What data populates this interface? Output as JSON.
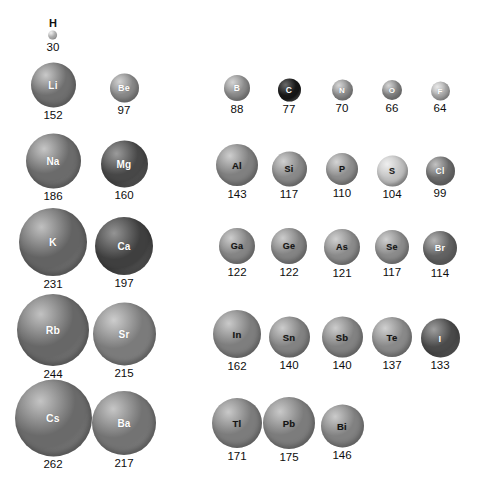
{
  "figure": {
    "units": "pm",
    "background_color": "#ffffff",
    "label_color": "#0d0d0d"
  },
  "chart_data": {
    "type": "scatter",
    "xlabel": "",
    "ylabel": "",
    "grid": false,
    "legend": "none",
    "value_units": "pm",
    "encoding": "sphere diameter proportional to atomic radius",
    "categories": [
      "H",
      "Li",
      "Be",
      "B",
      "C",
      "N",
      "O",
      "F",
      "Na",
      "Mg",
      "Al",
      "Si",
      "P",
      "S",
      "Cl",
      "K",
      "Ca",
      "Ga",
      "Ge",
      "As",
      "Se",
      "Br",
      "Rb",
      "Sr",
      "In",
      "Sn",
      "Sb",
      "Te",
      "I",
      "Cs",
      "Ba",
      "Tl",
      "Pb",
      "Bi"
    ],
    "values": [
      30,
      152,
      97,
      88,
      77,
      70,
      66,
      64,
      186,
      160,
      143,
      117,
      110,
      104,
      99,
      231,
      197,
      122,
      122,
      121,
      117,
      114,
      244,
      215,
      162,
      140,
      140,
      137,
      133,
      262,
      217,
      171,
      175,
      146
    ]
  },
  "elements": [
    {
      "symbol": "H",
      "radius": "30",
      "cx": 53,
      "top": 17,
      "d": 9,
      "base": "#d8d8d8",
      "hi": "#ffffff",
      "text": "#2a2a2a",
      "fs": 6,
      "label_above": true
    },
    {
      "symbol": "Li",
      "radius": "152",
      "cx": 53,
      "top": 62,
      "d": 45,
      "base": "#6f6f6f",
      "hi": "#c9c9c9",
      "text": "#ffffff",
      "fs": 10
    },
    {
      "symbol": "Be",
      "radius": "97",
      "cx": 124,
      "top": 73,
      "d": 29,
      "base": "#8a8a8a",
      "hi": "#d2d2d2",
      "text": "#ffffff",
      "fs": 9
    },
    {
      "symbol": "B",
      "radius": "88",
      "cx": 237,
      "top": 75,
      "d": 26,
      "base": "#8f8f8f",
      "hi": "#d4d4d4",
      "text": "#ffffff",
      "fs": 8.5
    },
    {
      "symbol": "C",
      "radius": "77",
      "cx": 289,
      "top": 78,
      "d": 23,
      "base": "#171717",
      "hi": "#6a6a6a",
      "text": "#ffffff",
      "fs": 8.5
    },
    {
      "symbol": "N",
      "radius": "70",
      "cx": 342,
      "top": 79,
      "d": 21,
      "base": "#939393",
      "hi": "#d6d6d6",
      "text": "#ffffff",
      "fs": 8
    },
    {
      "symbol": "O",
      "radius": "66",
      "cx": 392,
      "top": 80,
      "d": 20,
      "base": "#8c8c8c",
      "hi": "#d5d5d5",
      "text": "#ffffff",
      "fs": 8
    },
    {
      "symbol": "F",
      "radius": "64",
      "cx": 440,
      "top": 81,
      "d": 19,
      "base": "#b4b4b4",
      "hi": "#e8e8e8",
      "text": "#ffffff",
      "fs": 8
    },
    {
      "symbol": "Na",
      "radius": "186",
      "cx": 53,
      "top": 133,
      "d": 55,
      "base": "#6b6b6b",
      "hi": "#c6c6c6",
      "text": "#ffffff",
      "fs": 10
    },
    {
      "symbol": "Mg",
      "radius": "160",
      "cx": 124,
      "top": 140,
      "d": 47,
      "base": "#474747",
      "hi": "#9b9b9b",
      "text": "#ffffff",
      "fs": 10
    },
    {
      "symbol": "Al",
      "radius": "143",
      "cx": 237,
      "top": 144,
      "d": 42,
      "base": "#808080",
      "hi": "#cecece",
      "text": "#141414",
      "fs": 9.5
    },
    {
      "symbol": "Si",
      "radius": "117",
      "cx": 289,
      "top": 151,
      "d": 35,
      "base": "#898989",
      "hi": "#d0d0d0",
      "text": "#141414",
      "fs": 9
    },
    {
      "symbol": "P",
      "radius": "110",
      "cx": 342,
      "top": 153,
      "d": 32,
      "base": "#8e8e8e",
      "hi": "#d4d4d4",
      "text": "#141414",
      "fs": 9
    },
    {
      "symbol": "S",
      "radius": "104",
      "cx": 392,
      "top": 155,
      "d": 31,
      "base": "#c2c2c2",
      "hi": "#efefef",
      "text": "#1a1a1a",
      "fs": 9
    },
    {
      "symbol": "Cl",
      "radius": "99",
      "cx": 440,
      "top": 156,
      "d": 29,
      "base": "#6e6e6e",
      "hi": "#c2c2c2",
      "text": "#ffffff",
      "fs": 8.5
    },
    {
      "symbol": "K",
      "radius": "231",
      "cx": 53,
      "top": 208,
      "d": 68,
      "base": "#636363",
      "hi": "#c0c0c0",
      "text": "#ffffff",
      "fs": 10.5
    },
    {
      "symbol": "Ca",
      "radius": "197",
      "cx": 124,
      "top": 217,
      "d": 58,
      "base": "#3f3f3f",
      "hi": "#949494",
      "text": "#ffffff",
      "fs": 10
    },
    {
      "symbol": "Ga",
      "radius": "122",
      "cx": 237,
      "top": 228,
      "d": 36,
      "base": "#858585",
      "hi": "#cdcdcd",
      "text": "#141414",
      "fs": 9
    },
    {
      "symbol": "Ge",
      "radius": "122",
      "cx": 289,
      "top": 228,
      "d": 36,
      "base": "#848484",
      "hi": "#cccccc",
      "text": "#141414",
      "fs": 9
    },
    {
      "symbol": "As",
      "radius": "121",
      "cx": 342,
      "top": 229,
      "d": 36,
      "base": "#8b8b8b",
      "hi": "#d0d0d0",
      "text": "#141414",
      "fs": 9
    },
    {
      "symbol": "Se",
      "radius": "117",
      "cx": 392,
      "top": 230,
      "d": 34,
      "base": "#8b8b8b",
      "hi": "#d0d0d0",
      "text": "#141414",
      "fs": 9
    },
    {
      "symbol": "Br",
      "radius": "114",
      "cx": 440,
      "top": 231,
      "d": 34,
      "base": "#626262",
      "hi": "#b4b4b4",
      "text": "#ffffff",
      "fs": 9
    },
    {
      "symbol": "Rb",
      "radius": "244",
      "cx": 53,
      "top": 294,
      "d": 72,
      "base": "#676767",
      "hi": "#c2c2c2",
      "text": "#ffffff",
      "fs": 10.5
    },
    {
      "symbol": "Sr",
      "radius": "215",
      "cx": 124,
      "top": 302,
      "d": 63,
      "base": "#7b7b7b",
      "hi": "#cdcdcd",
      "text": "#ffffff",
      "fs": 10
    },
    {
      "symbol": "In",
      "radius": "162",
      "cx": 237,
      "top": 310,
      "d": 48,
      "base": "#7e7e7e",
      "hi": "#cacaca",
      "text": "#141414",
      "fs": 9.5
    },
    {
      "symbol": "Sn",
      "radius": "140",
      "cx": 289,
      "top": 316,
      "d": 41,
      "base": "#828282",
      "hi": "#cccccc",
      "text": "#141414",
      "fs": 9.5
    },
    {
      "symbol": "Sb",
      "radius": "140",
      "cx": 342,
      "top": 316,
      "d": 41,
      "base": "#828282",
      "hi": "#cccccc",
      "text": "#141414",
      "fs": 9.5
    },
    {
      "symbol": "Te",
      "radius": "137",
      "cx": 392,
      "top": 317,
      "d": 40,
      "base": "#898989",
      "hi": "#d0d0d0",
      "text": "#141414",
      "fs": 9.5
    },
    {
      "symbol": "I",
      "radius": "133",
      "cx": 440,
      "top": 318,
      "d": 39,
      "base": "#4a4a4a",
      "hi": "#9e9e9e",
      "text": "#ffffff",
      "fs": 9.5
    },
    {
      "symbol": "Cs",
      "radius": "262",
      "cx": 53,
      "top": 379,
      "d": 77,
      "base": "#6a6a6a",
      "hi": "#c4c4c4",
      "text": "#ffffff",
      "fs": 10.5
    },
    {
      "symbol": "Ba",
      "radius": "217",
      "cx": 124,
      "top": 391,
      "d": 64,
      "base": "#737373",
      "hi": "#c6c6c6",
      "text": "#ffffff",
      "fs": 10
    },
    {
      "symbol": "Tl",
      "radius": "171",
      "cx": 237,
      "top": 398,
      "d": 50,
      "base": "#7c7c7c",
      "hi": "#c9c9c9",
      "text": "#141414",
      "fs": 9.5
    },
    {
      "symbol": "Pb",
      "radius": "175",
      "cx": 289,
      "top": 397,
      "d": 52,
      "base": "#7c7c7c",
      "hi": "#c9c9c9",
      "text": "#141414",
      "fs": 9.5
    },
    {
      "symbol": "Bi",
      "radius": "146",
      "cx": 342,
      "top": 404,
      "d": 43,
      "base": "#818181",
      "hi": "#cbcbcb",
      "text": "#141414",
      "fs": 9.5
    }
  ]
}
